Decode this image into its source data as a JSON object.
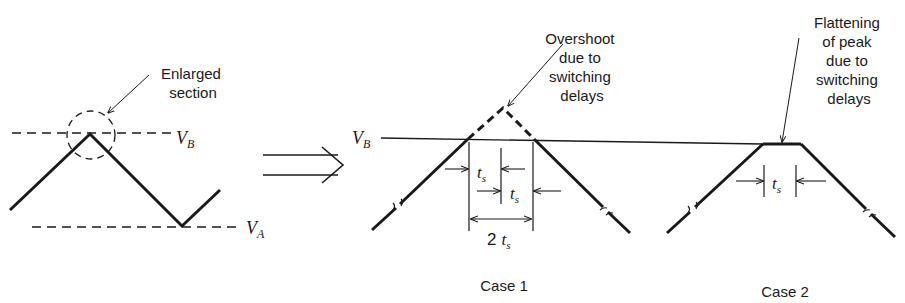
{
  "left_panel": {
    "annotation_line1": "Enlarged",
    "annotation_line2": "section",
    "upper_level": {
      "symbol": "V",
      "subscript": "B"
    },
    "lower_level": {
      "symbol": "V",
      "subscript": "A"
    }
  },
  "transition_arrow": "double-right-arrow",
  "case1": {
    "caption": "Case 1",
    "level": {
      "symbol": "V",
      "subscript": "B"
    },
    "annotation": [
      "Overshoot",
      "due to",
      "switching",
      "delays"
    ],
    "dim1": {
      "symbol": "t",
      "subscript": "s"
    },
    "dim2": {
      "symbol": "t",
      "subscript": "s"
    },
    "dim_total": {
      "prefix": "2",
      "symbol": "t",
      "subscript": "s"
    }
  },
  "case2": {
    "caption": "Case 2",
    "annotation": [
      "Flattening",
      "of peak",
      "due to",
      "switching",
      "delays"
    ],
    "dim": {
      "symbol": "t",
      "subscript": "s"
    }
  },
  "colors": {
    "ink": "#1a1a1a",
    "background": "#ffffff"
  }
}
